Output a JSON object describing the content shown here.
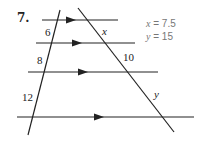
{
  "problem": {
    "number": "7.",
    "segments_left": [
      "6",
      "8",
      "12"
    ],
    "segments_right": [
      "x",
      "10",
      "y"
    ],
    "answers": [
      {
        "var": "x",
        "eq": "= 7.5"
      },
      {
        "var": "y",
        "eq": "= 15"
      }
    ]
  },
  "colors": {
    "line": "#222222",
    "answer": "#777777"
  }
}
